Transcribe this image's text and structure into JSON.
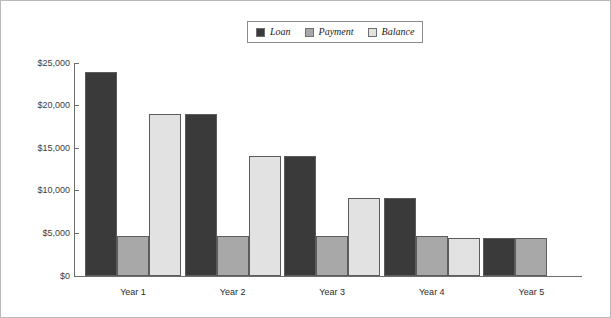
{
  "chart_data": {
    "type": "bar",
    "title": "",
    "xlabel": "",
    "ylabel": "",
    "categories": [
      "Year 1",
      "Year 2",
      "Year 3",
      "Year 4",
      "Year 5"
    ],
    "series": [
      {
        "name": "Loan",
        "color": "#3a3a3a",
        "values": [
          24000,
          19000,
          14100,
          9200,
          4500
        ]
      },
      {
        "name": "Payment",
        "color": "#a8a8a8",
        "values": [
          4700,
          4700,
          4700,
          4700,
          4500
        ]
      },
      {
        "name": "Balance",
        "color": "#e2e2e2",
        "values": [
          19000,
          14100,
          9200,
          4500,
          0
        ]
      }
    ],
    "ylim": [
      0,
      25000
    ],
    "yticks": [
      0,
      5000,
      10000,
      15000,
      20000,
      25000
    ],
    "ytick_labels": [
      "$0",
      "$5,000",
      "$10,000",
      "$15,000",
      "$20,000",
      "$25,000"
    ],
    "grid": false,
    "legend_position": "top-center"
  }
}
